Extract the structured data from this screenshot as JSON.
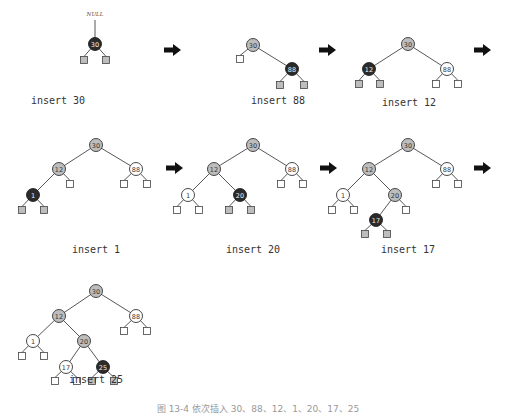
{
  "legend": {
    "red_node_color": "#2b2b2b",
    "black_node_color": "#bdbdbd",
    "recolored_node_color": "#ffffff"
  },
  "steps": [
    {
      "caption": "insert 30",
      "caption_pos": [
        58,
        104
      ],
      "parent_label": "NULL",
      "parent_label_pos": [
        95,
        16
      ],
      "nodes": [
        {
          "key": "30",
          "x": 95,
          "y": 44,
          "style": "red"
        }
      ],
      "edges": [
        [
          95,
          20,
          95,
          38
        ]
      ],
      "nils": [
        {
          "x": 84,
          "y": 60,
          "style": "grey",
          "from": [
            95,
            44
          ]
        },
        {
          "x": 106,
          "y": 60,
          "style": "grey",
          "from": [
            95,
            44
          ]
        }
      ]
    },
    {
      "caption": "insert 88",
      "caption_pos": [
        278,
        104
      ],
      "nodes": [
        {
          "key": "30",
          "x": 253,
          "y": 45,
          "style": "black"
        },
        {
          "key": "88",
          "x": 292,
          "y": 69,
          "style": "red"
        }
      ],
      "edges": [
        [
          253,
          45,
          292,
          69
        ]
      ],
      "nils": [
        {
          "x": 240,
          "y": 59,
          "style": "white",
          "from": [
            253,
            45
          ]
        },
        {
          "x": 280,
          "y": 85,
          "style": "grey",
          "from": [
            292,
            69
          ]
        },
        {
          "x": 304,
          "y": 85,
          "style": "grey",
          "from": [
            292,
            69
          ]
        }
      ]
    },
    {
      "caption": "insert 12",
      "caption_pos": [
        409,
        106
      ],
      "nodes": [
        {
          "key": "30",
          "x": 408,
          "y": 44,
          "style": "black"
        },
        {
          "key": "12",
          "x": 369,
          "y": 69,
          "style": "red"
        },
        {
          "key": "88",
          "x": 447,
          "y": 69,
          "style": "white"
        }
      ],
      "edges": [
        [
          408,
          44,
          369,
          69
        ],
        [
          408,
          44,
          447,
          69
        ]
      ],
      "nils": [
        {
          "x": 359,
          "y": 84,
          "style": "grey",
          "from": [
            369,
            69
          ]
        },
        {
          "x": 380,
          "y": 84,
          "style": "grey",
          "from": [
            369,
            69
          ]
        },
        {
          "x": 436,
          "y": 84,
          "style": "white",
          "from": [
            447,
            69
          ]
        },
        {
          "x": 458,
          "y": 84,
          "style": "white",
          "from": [
            447,
            69
          ]
        }
      ]
    },
    {
      "caption": "insert 1",
      "caption_pos": [
        96,
        253
      ],
      "nodes": [
        {
          "key": "30",
          "x": 96,
          "y": 145,
          "style": "black"
        },
        {
          "key": "12",
          "x": 59,
          "y": 169,
          "style": "black"
        },
        {
          "key": "88",
          "x": 136,
          "y": 169,
          "style": "white"
        },
        {
          "key": "1",
          "x": 33,
          "y": 195,
          "style": "red"
        }
      ],
      "edges": [
        [
          96,
          145,
          59,
          169
        ],
        [
          96,
          145,
          136,
          169
        ],
        [
          59,
          169,
          33,
          195
        ]
      ],
      "nils": [
        {
          "x": 70,
          "y": 184,
          "style": "white",
          "from": [
            59,
            169
          ]
        },
        {
          "x": 124,
          "y": 184,
          "style": "white",
          "from": [
            136,
            169
          ]
        },
        {
          "x": 147,
          "y": 184,
          "style": "white",
          "from": [
            136,
            169
          ]
        },
        {
          "x": 22,
          "y": 210,
          "style": "grey",
          "from": [
            33,
            195
          ]
        },
        {
          "x": 44,
          "y": 210,
          "style": "grey",
          "from": [
            33,
            195
          ]
        }
      ]
    },
    {
      "caption": "insert 20",
      "caption_pos": [
        253,
        253
      ],
      "nodes": [
        {
          "key": "30",
          "x": 253,
          "y": 145,
          "style": "black"
        },
        {
          "key": "12",
          "x": 214,
          "y": 169,
          "style": "black"
        },
        {
          "key": "88",
          "x": 292,
          "y": 169,
          "style": "white"
        },
        {
          "key": "1",
          "x": 188,
          "y": 195,
          "style": "white"
        },
        {
          "key": "20",
          "x": 240,
          "y": 195,
          "style": "red"
        }
      ],
      "edges": [
        [
          253,
          145,
          214,
          169
        ],
        [
          253,
          145,
          292,
          169
        ],
        [
          214,
          169,
          188,
          195
        ],
        [
          214,
          169,
          240,
          195
        ]
      ],
      "nils": [
        {
          "x": 281,
          "y": 184,
          "style": "white",
          "from": [
            292,
            169
          ]
        },
        {
          "x": 303,
          "y": 184,
          "style": "white",
          "from": [
            292,
            169
          ]
        },
        {
          "x": 177,
          "y": 210,
          "style": "white",
          "from": [
            188,
            195
          ]
        },
        {
          "x": 199,
          "y": 210,
          "style": "white",
          "from": [
            188,
            195
          ]
        },
        {
          "x": 229,
          "y": 210,
          "style": "grey",
          "from": [
            240,
            195
          ]
        },
        {
          "x": 251,
          "y": 210,
          "style": "grey",
          "from": [
            240,
            195
          ]
        }
      ]
    },
    {
      "caption": "insert 17",
      "caption_pos": [
        408,
        253
      ],
      "nodes": [
        {
          "key": "30",
          "x": 408,
          "y": 145,
          "style": "black"
        },
        {
          "key": "12",
          "x": 369,
          "y": 169,
          "style": "black"
        },
        {
          "key": "88",
          "x": 447,
          "y": 169,
          "style": "white"
        },
        {
          "key": "1",
          "x": 343,
          "y": 195,
          "style": "white"
        },
        {
          "key": "20",
          "x": 395,
          "y": 195,
          "style": "black"
        },
        {
          "key": "17",
          "x": 376,
          "y": 220,
          "style": "red"
        }
      ],
      "edges": [
        [
          408,
          145,
          369,
          169
        ],
        [
          408,
          145,
          447,
          169
        ],
        [
          369,
          169,
          343,
          195
        ],
        [
          369,
          169,
          395,
          195
        ],
        [
          395,
          195,
          376,
          220
        ]
      ],
      "nils": [
        {
          "x": 436,
          "y": 184,
          "style": "white",
          "from": [
            447,
            169
          ]
        },
        {
          "x": 458,
          "y": 184,
          "style": "white",
          "from": [
            447,
            169
          ]
        },
        {
          "x": 332,
          "y": 210,
          "style": "white",
          "from": [
            343,
            195
          ]
        },
        {
          "x": 354,
          "y": 210,
          "style": "white",
          "from": [
            343,
            195
          ]
        },
        {
          "x": 406,
          "y": 210,
          "style": "white",
          "from": [
            395,
            195
          ]
        },
        {
          "x": 365,
          "y": 234,
          "style": "grey",
          "from": [
            376,
            220
          ]
        },
        {
          "x": 387,
          "y": 234,
          "style": "grey",
          "from": [
            376,
            220
          ]
        }
      ]
    },
    {
      "caption": "insert 25",
      "caption_pos": [
        96,
        383
      ],
      "nodes": [
        {
          "key": "30",
          "x": 96,
          "y": 291,
          "style": "black"
        },
        {
          "key": "12",
          "x": 59,
          "y": 316,
          "style": "black"
        },
        {
          "key": "88",
          "x": 136,
          "y": 316,
          "style": "white"
        },
        {
          "key": "1",
          "x": 33,
          "y": 341,
          "style": "white"
        },
        {
          "key": "20",
          "x": 84,
          "y": 341,
          "style": "black"
        },
        {
          "key": "17",
          "x": 66,
          "y": 367,
          "style": "white"
        },
        {
          "key": "25",
          "x": 103,
          "y": 367,
          "style": "red"
        }
      ],
      "edges": [
        [
          96,
          291,
          59,
          316
        ],
        [
          96,
          291,
          136,
          316
        ],
        [
          59,
          316,
          33,
          341
        ],
        [
          59,
          316,
          84,
          341
        ],
        [
          84,
          341,
          66,
          367
        ],
        [
          84,
          341,
          103,
          367
        ]
      ],
      "nils": [
        {
          "x": 124,
          "y": 331,
          "style": "white",
          "from": [
            136,
            316
          ]
        },
        {
          "x": 147,
          "y": 331,
          "style": "white",
          "from": [
            136,
            316
          ]
        },
        {
          "x": 22,
          "y": 356,
          "style": "white",
          "from": [
            33,
            341
          ]
        },
        {
          "x": 44,
          "y": 356,
          "style": "white",
          "from": [
            33,
            341
          ]
        },
        {
          "x": 55,
          "y": 381,
          "style": "white",
          "from": [
            66,
            367
          ]
        },
        {
          "x": 77,
          "y": 381,
          "style": "white",
          "from": [
            66,
            367
          ]
        },
        {
          "x": 92,
          "y": 381,
          "style": "grey",
          "from": [
            103,
            367
          ]
        },
        {
          "x": 114,
          "y": 381,
          "style": "grey",
          "from": [
            103,
            367
          ]
        }
      ]
    }
  ],
  "arrows": [
    {
      "x": 164,
      "y": 50
    },
    {
      "x": 319,
      "y": 50
    },
    {
      "x": 474,
      "y": 50
    },
    {
      "x": 166,
      "y": 168
    },
    {
      "x": 320,
      "y": 168
    },
    {
      "x": 474,
      "y": 168
    }
  ],
  "figure_caption": "图 13-4  依次插入 30、88、12、1、20、17、25",
  "figure_caption_pos": [
    258,
    412
  ]
}
